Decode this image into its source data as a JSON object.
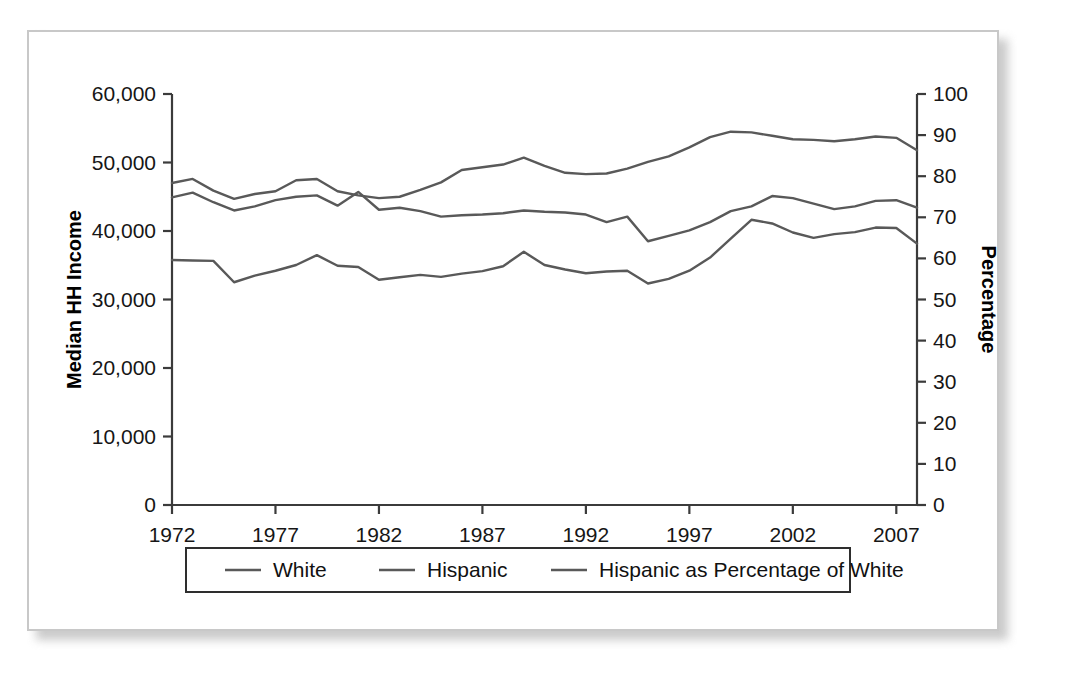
{
  "chart_data": {
    "type": "line",
    "title": "",
    "xlabel": "",
    "ylabel": "Median HH Income",
    "y2label": "Percentage",
    "x": [
      1972,
      1973,
      1974,
      1975,
      1976,
      1977,
      1978,
      1979,
      1980,
      1981,
      1982,
      1983,
      1984,
      1985,
      1986,
      1987,
      1988,
      1989,
      1990,
      1991,
      1992,
      1993,
      1994,
      1995,
      1996,
      1997,
      1998,
      1999,
      2000,
      2001,
      2002,
      2003,
      2004,
      2005,
      2006,
      2007,
      2008
    ],
    "xlim": [
      1972,
      2008
    ],
    "ylim": [
      0,
      60000
    ],
    "y2lim": [
      0,
      100
    ],
    "yticks": [
      0,
      10000,
      20000,
      30000,
      40000,
      50000,
      60000
    ],
    "ytick_labels": [
      "0",
      "10,000",
      "20,000",
      "30,000",
      "40,000",
      "50,000",
      "60,000"
    ],
    "y2ticks": [
      0,
      10,
      20,
      30,
      40,
      50,
      60,
      70,
      80,
      90,
      100
    ],
    "y2tick_labels": [
      "0",
      "10",
      "20",
      "30",
      "40",
      "50",
      "60",
      "70",
      "80",
      "90",
      "100"
    ],
    "xticks": [
      1972,
      1977,
      1982,
      1987,
      1992,
      1997,
      2002,
      2007
    ],
    "xtick_labels": [
      "1972",
      "1977",
      "1982",
      "1987",
      "1992",
      "1997",
      "2002",
      "2007"
    ],
    "grid": false,
    "legend_position": "bottom",
    "series": [
      {
        "name": "White",
        "axis": "left",
        "color": "#595959",
        "values": [
          47000,
          47600,
          45900,
          44700,
          45400,
          45800,
          47400,
          47600,
          45800,
          45200,
          44800,
          45000,
          46000,
          47100,
          48900,
          49300,
          49700,
          50700,
          49500,
          48500,
          48300,
          48400,
          49100,
          50100,
          50900,
          52200,
          53700,
          54500,
          54400,
          53900,
          53400,
          53300,
          53100,
          53400,
          53800,
          53600,
          51800
        ]
      },
      {
        "name": "Hispanic",
        "axis": "left",
        "color": "#595959",
        "values": [
          44900,
          45600,
          44200,
          43000,
          43600,
          44500,
          45000,
          45200,
          43700,
          45700,
          43100,
          43400,
          42900,
          42100,
          42300,
          42400,
          42600,
          43000,
          42800,
          42700,
          42400,
          41300,
          42100,
          38500,
          39300,
          40100,
          41300,
          42900,
          43600,
          45100,
          44800,
          44000,
          43200,
          43600,
          44400,
          44500,
          43400
        ]
      },
      {
        "name": "Hispanic as Percentage of White",
        "axis": "right",
        "color": "#595959",
        "values": [
          59.6,
          59.5,
          59.4,
          54.2,
          55.8,
          57.0,
          58.4,
          60.8,
          58.2,
          57.9,
          54.8,
          55.4,
          56.0,
          55.5,
          56.3,
          56.9,
          58.1,
          61.6,
          58.4,
          57.3,
          56.4,
          56.8,
          57.0,
          53.9,
          55.0,
          57.0,
          60.2,
          64.8,
          69.4,
          68.5,
          66.3,
          65.0,
          65.9,
          66.4,
          67.5,
          67.4,
          63.6
        ]
      }
    ]
  },
  "legend": {
    "entries": [
      {
        "label": "White"
      },
      {
        "label": "Hispanic"
      },
      {
        "label": "Hispanic as Percentage of White"
      }
    ]
  }
}
